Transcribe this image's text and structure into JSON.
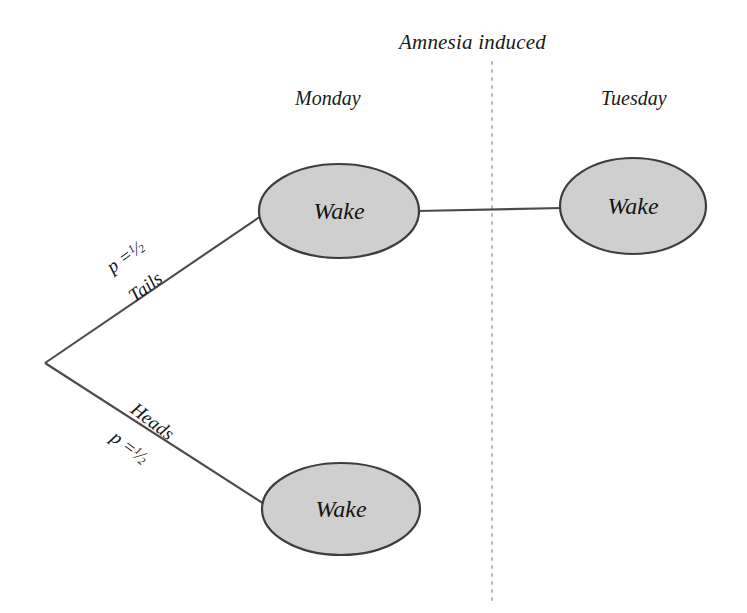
{
  "diagram": {
    "title": "Amnesia induced",
    "columns": [
      {
        "id": "monday",
        "label": "Monday"
      },
      {
        "id": "tuesday",
        "label": "Tuesday"
      }
    ],
    "nodes": [
      {
        "id": "monday-wake",
        "label": "Wake",
        "column": "monday",
        "cx": 339,
        "cy": 211,
        "rx": 80,
        "ry": 47
      },
      {
        "id": "tuesday-wake",
        "label": "Wake",
        "column": "tuesday",
        "cx": 633,
        "cy": 206,
        "rx": 73,
        "ry": 48
      },
      {
        "id": "monday-wake-heads",
        "label": "Wake",
        "column": "monday",
        "cx": 341,
        "cy": 509,
        "rx": 79,
        "ry": 46
      }
    ],
    "branches": [
      {
        "id": "tails",
        "outcome": "Tails",
        "probability_label": "p =",
        "probability_numerator": "1",
        "probability_denominator": "2",
        "from": "root",
        "to": "monday-wake"
      },
      {
        "id": "heads",
        "outcome": "Heads",
        "probability_label": "p =",
        "probability_numerator": "1",
        "probability_denominator": "2",
        "from": "root",
        "to": "monday-wake-heads"
      }
    ],
    "connector": {
      "id": "monday-to-tuesday",
      "from": "monday-wake",
      "to": "tuesday-wake"
    },
    "divider": {
      "id": "amnesia-divider",
      "style": "dotted",
      "x": 492
    },
    "colors": {
      "background": "#ffffff",
      "node_fill": "#cfcfcf",
      "node_stroke": "#3d3d3d",
      "edge": "#4a4a4a",
      "divider": "#b9b9b9",
      "text": "#141414"
    }
  }
}
